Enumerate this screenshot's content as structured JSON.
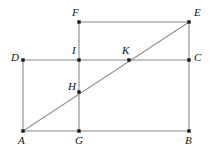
{
  "figure": {
    "canvas": {
      "width": 211,
      "height": 153
    },
    "style": {
      "line_color": "#8a8a8a",
      "diagonal_color": "#8f8f8f",
      "vertex_color": "#1a1a1a",
      "label_color": "#111111",
      "background_color": "#ffffff"
    },
    "points": [
      {
        "id": "A",
        "label": "A",
        "x": 23,
        "y": 131,
        "label_x": 18,
        "label_y": 135
      },
      {
        "id": "B",
        "label": "B",
        "x": 189,
        "y": 131,
        "label_x": 185,
        "label_y": 135
      },
      {
        "id": "C",
        "label": "C",
        "x": 189,
        "y": 60,
        "label_x": 194,
        "label_y": 52
      },
      {
        "id": "D",
        "label": "D",
        "x": 23,
        "y": 60,
        "label_x": 11,
        "label_y": 52
      },
      {
        "id": "E",
        "label": "E",
        "x": 189,
        "y": 22,
        "label_x": 194,
        "label_y": 7
      },
      {
        "id": "F",
        "label": "F",
        "x": 79,
        "y": 22,
        "label_x": 72,
        "label_y": 7
      },
      {
        "id": "G",
        "label": "G",
        "x": 79,
        "y": 131,
        "label_x": 75,
        "label_y": 135
      },
      {
        "id": "H",
        "label": "H",
        "x": 79,
        "y": 92,
        "label_x": 68,
        "label_y": 81
      },
      {
        "id": "I",
        "label": "I",
        "x": 79,
        "y": 60,
        "label_x": 72,
        "label_y": 45
      },
      {
        "id": "K",
        "label": "K",
        "x": 129,
        "y": 60,
        "label_x": 122,
        "label_y": 45
      }
    ],
    "segments": [
      {
        "id": "AB",
        "name": "segment-ab",
        "x1": 23,
        "y1": 131,
        "x2": 189,
        "y2": 131
      },
      {
        "id": "AD",
        "name": "segment-ad",
        "x1": 23,
        "y1": 131,
        "x2": 23,
        "y2": 60
      },
      {
        "id": "DC",
        "name": "segment-dc",
        "x1": 23,
        "y1": 60,
        "x2": 189,
        "y2": 60
      },
      {
        "id": "BC",
        "name": "segment-bc",
        "x1": 189,
        "y1": 131,
        "x2": 189,
        "y2": 60
      },
      {
        "id": "CE",
        "name": "segment-ce",
        "x1": 189,
        "y1": 60,
        "x2": 189,
        "y2": 22
      },
      {
        "id": "FE",
        "name": "segment-fe",
        "x1": 79,
        "y1": 22,
        "x2": 189,
        "y2": 22
      },
      {
        "id": "FG",
        "name": "segment-fg",
        "x1": 79,
        "y1": 22,
        "x2": 79,
        "y2": 131
      }
    ],
    "diagonal": {
      "id": "AE",
      "name": "diagonal-ae",
      "x1": 23,
      "y1": 131,
      "x2": 189,
      "y2": 22,
      "passes_through": [
        "H",
        "K"
      ]
    }
  }
}
